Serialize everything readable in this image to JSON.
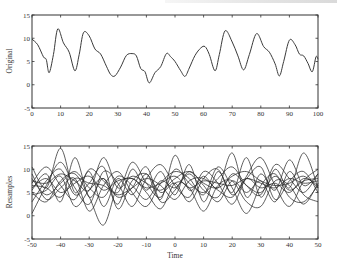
{
  "chart_data": [
    {
      "type": "line",
      "title": "",
      "xlabel": "",
      "ylabel": "Original",
      "xlim": [
        0,
        100
      ],
      "ylim": [
        -5,
        15
      ],
      "xticks": [
        0,
        10,
        20,
        30,
        40,
        50,
        60,
        70,
        80,
        90,
        100
      ],
      "yticks": [
        -5,
        0,
        5,
        10,
        15
      ],
      "grid": false,
      "series": [
        {
          "name": "Original",
          "x": [
            0,
            2,
            4,
            5,
            6,
            7.5,
            9,
            11,
            13,
            15,
            16.5,
            18,
            20,
            22,
            24,
            26,
            27.5,
            29,
            31,
            33,
            35,
            36.5,
            38,
            39.5,
            41,
            43,
            45,
            47,
            48.5,
            50,
            52,
            53.5,
            55,
            57,
            59,
            60.5,
            62,
            64,
            65.5,
            67.5,
            70,
            72,
            74,
            76,
            78.5,
            81,
            83,
            85,
            86.5,
            88,
            90,
            92,
            93.5,
            95,
            96.5,
            98,
            99.3,
            100
          ],
          "y": [
            9.8,
            8.6,
            6.0,
            5.4,
            2.6,
            6.5,
            12.0,
            9.0,
            7.0,
            3.0,
            6.5,
            11.2,
            10.5,
            7.7,
            6.6,
            4.0,
            2.2,
            1.9,
            3.8,
            6.3,
            6.7,
            6.2,
            3.5,
            2.8,
            0.4,
            2.6,
            3.9,
            6.7,
            6.0,
            5.0,
            3.0,
            1.8,
            3.6,
            6.3,
            7.9,
            8.2,
            6.5,
            3.0,
            6.5,
            11.6,
            9.2,
            6.2,
            3.2,
            6.5,
            11.0,
            8.2,
            7.0,
            4.5,
            1.9,
            5.0,
            9.6,
            8.6,
            6.6,
            6.2,
            4.6,
            2.8,
            6.0,
            5.5
          ]
        }
      ]
    },
    {
      "type": "line",
      "title": "",
      "xlabel": "Time",
      "ylabel": "Resamples",
      "xlim": [
        -50,
        50
      ],
      "ylim": [
        -5,
        15
      ],
      "xticks": [
        -50,
        -40,
        -30,
        -20,
        -10,
        0,
        10,
        20,
        30,
        40,
        50
      ],
      "yticks": [
        -5,
        0,
        5,
        10,
        15
      ],
      "grid": false,
      "x": [
        -50,
        -45,
        -40,
        -35,
        -30,
        -25,
        -20,
        -15,
        -10,
        -5,
        0,
        5,
        10,
        15,
        20,
        25,
        30,
        35,
        40,
        45,
        50
      ],
      "series": [
        {
          "name": "resample-1",
          "values": [
            10.5,
            6.0,
            14.5,
            5.0,
            9.5,
            2.0,
            8.0,
            4.5,
            9.0,
            3.5,
            13.0,
            5.5,
            8.5,
            6.0,
            13.5,
            4.0,
            9.0,
            5.5,
            12.0,
            6.5,
            9.0
          ]
        },
        {
          "name": "resample-2",
          "values": [
            5.5,
            9.0,
            3.0,
            12.5,
            4.0,
            8.0,
            2.5,
            10.0,
            5.5,
            9.5,
            4.5,
            11.0,
            3.0,
            9.5,
            5.0,
            12.5,
            4.0,
            10.0,
            6.0,
            13.5,
            6.0
          ]
        },
        {
          "name": "resample-3",
          "values": [
            3.0,
            7.5,
            10.0,
            4.5,
            7.0,
            10.5,
            1.5,
            7.5,
            9.0,
            5.0,
            7.0,
            3.0,
            8.0,
            10.0,
            4.5,
            8.0,
            10.5,
            3.5,
            7.5,
            9.5,
            5.0
          ]
        },
        {
          "name": "resample-4",
          "values": [
            8.0,
            4.5,
            7.0,
            9.5,
            6.0,
            4.0,
            8.5,
            6.5,
            3.5,
            7.5,
            6.0,
            9.0,
            5.5,
            4.0,
            9.0,
            6.5,
            5.0,
            8.5,
            5.5,
            7.5,
            8.0
          ]
        },
        {
          "name": "resample-5",
          "values": [
            0.5,
            6.5,
            11.5,
            6.0,
            2.5,
            9.5,
            7.0,
            2.0,
            8.0,
            11.0,
            6.5,
            4.0,
            9.5,
            7.0,
            2.5,
            8.5,
            12.5,
            6.5,
            2.0,
            7.5,
            10.0
          ]
        },
        {
          "name": "resample-6",
          "values": [
            6.0,
            8.0,
            5.0,
            7.0,
            8.5,
            5.5,
            7.5,
            8.0,
            6.0,
            7.0,
            8.5,
            6.0,
            7.5,
            7.0,
            6.5,
            8.0,
            7.0,
            6.0,
            8.0,
            7.0,
            7.5
          ]
        },
        {
          "name": "resample-7",
          "values": [
            9.0,
            3.5,
            6.0,
            8.0,
            1.0,
            6.5,
            9.5,
            5.0,
            2.0,
            7.0,
            9.5,
            8.0,
            4.5,
            10.5,
            6.0,
            0.5,
            6.5,
            9.0,
            4.0,
            3.0,
            6.5
          ]
        },
        {
          "name": "resample-8",
          "values": [
            7.0,
            10.5,
            6.5,
            3.5,
            10.0,
            7.5,
            5.0,
            11.5,
            7.0,
            4.0,
            10.0,
            7.0,
            5.0,
            8.0,
            10.5,
            6.5,
            4.5,
            11.0,
            8.0,
            5.0,
            9.0
          ]
        },
        {
          "name": "resample-9",
          "values": [
            4.5,
            5.5,
            8.5,
            2.0,
            5.5,
            8.0,
            4.0,
            6.0,
            10.5,
            3.0,
            5.5,
            9.5,
            6.5,
            3.0,
            7.5,
            5.0,
            7.5,
            3.0,
            9.5,
            4.5,
            3.0
          ]
        },
        {
          "name": "resample-10",
          "values": [
            7.5,
            7.0,
            9.0,
            7.5,
            5.5,
            12.5,
            6.0,
            8.5,
            7.0,
            5.5,
            8.0,
            9.5,
            7.0,
            6.0,
            8.5,
            9.5,
            7.5,
            6.5,
            7.0,
            8.5,
            6.0
          ]
        },
        {
          "name": "resample-11",
          "values": [
            5.0,
            3.0,
            7.5,
            9.0,
            4.0,
            -2.0,
            6.5,
            8.0,
            5.0,
            1.5,
            7.0,
            6.0,
            1.0,
            6.5,
            7.5,
            3.0,
            2.0,
            7.5,
            6.5,
            2.5,
            7.0
          ]
        },
        {
          "name": "resample-12",
          "values": [
            6.5,
            6.0,
            4.0,
            8.0,
            7.0,
            6.5,
            4.5,
            6.0,
            8.0,
            6.5,
            3.5,
            7.5,
            8.0,
            5.5,
            4.0,
            8.0,
            6.0,
            7.0,
            5.0,
            8.0,
            6.5
          ]
        }
      ]
    }
  ]
}
